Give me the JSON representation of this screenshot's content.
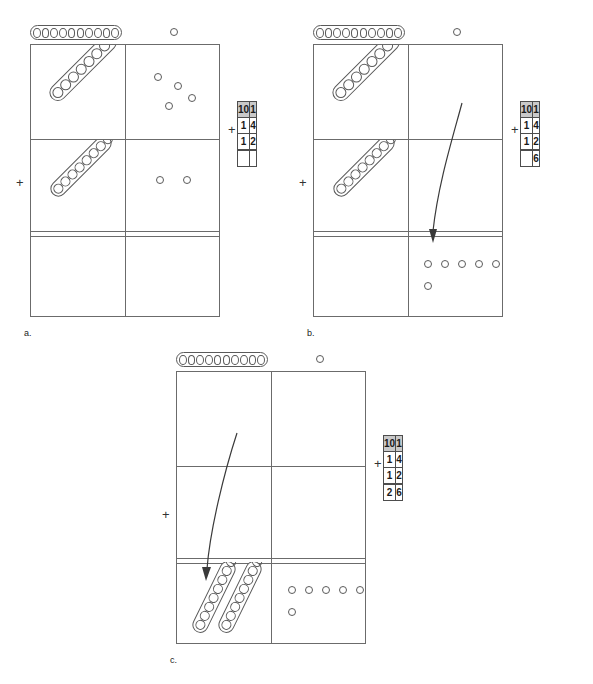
{
  "worksheet": {
    "problem": "14 + 12 = 26",
    "plus_sign": "+"
  },
  "legend": {
    "rod_beads": 10,
    "rod_name": "ten-rod",
    "dot_name": "one-unit"
  },
  "table_headers": {
    "tens": "10",
    "ones": "1"
  },
  "panels": [
    {
      "id": "a",
      "label": "a.",
      "plus": "+",
      "rows": [
        {
          "name": "addend-one",
          "tens_rods": 1,
          "ones_dots": 4
        },
        {
          "name": "addend-two",
          "tens_rods": 1,
          "ones_dots": 2
        },
        {
          "name": "sum",
          "tens_rods": 0,
          "ones_dots": 0
        }
      ],
      "table": {
        "headers": {
          "tens": "10",
          "ones": "1"
        },
        "rows": [
          {
            "tens": "1",
            "ones": "4"
          },
          {
            "tens": "1",
            "ones": "2"
          }
        ],
        "answer": {
          "tens": "",
          "ones": ""
        }
      },
      "arrow": false
    },
    {
      "id": "b",
      "label": "b.",
      "plus": "+",
      "rows": [
        {
          "name": "addend-one",
          "tens_rods": 1,
          "ones_dots": 0
        },
        {
          "name": "addend-two",
          "tens_rods": 1,
          "ones_dots": 0
        },
        {
          "name": "sum",
          "tens_rods": 0,
          "ones_dots": 6
        }
      ],
      "table": {
        "headers": {
          "tens": "10",
          "ones": "1"
        },
        "rows": [
          {
            "tens": "1",
            "ones": "4"
          },
          {
            "tens": "1",
            "ones": "2"
          }
        ],
        "answer": {
          "tens": "",
          "ones": "6"
        }
      },
      "arrow": true
    },
    {
      "id": "c",
      "label": "c.",
      "plus": "+",
      "rows": [
        {
          "name": "addend-one",
          "tens_rods": 0,
          "ones_dots": 0
        },
        {
          "name": "addend-two",
          "tens_rods": 0,
          "ones_dots": 0
        },
        {
          "name": "sum",
          "tens_rods": 2,
          "ones_dots": 6
        }
      ],
      "table": {
        "headers": {
          "tens": "10",
          "ones": "1"
        },
        "rows": [
          {
            "tens": "1",
            "ones": "4"
          },
          {
            "tens": "1",
            "ones": "2"
          }
        ],
        "answer": {
          "tens": "2",
          "ones": "6"
        }
      },
      "arrow": true
    }
  ]
}
